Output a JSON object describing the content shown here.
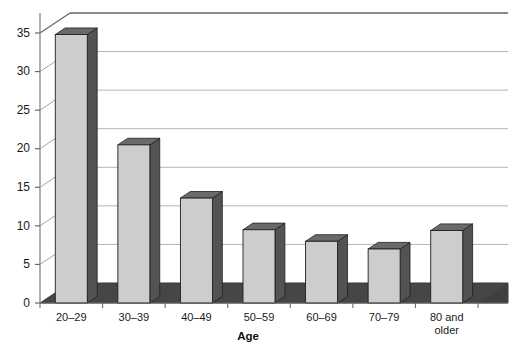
{
  "chart_data": {
    "type": "bar",
    "title": "",
    "subtitle": "",
    "xlabel": "Age",
    "ylabel": "",
    "categories": [
      "20–29",
      "30–39",
      "40–49",
      "50–59",
      "60–69",
      "70–79",
      "80 and older"
    ],
    "values": [
      34.8,
      20.5,
      13.6,
      9.5,
      8.0,
      7.0,
      9.4
    ],
    "ylim": [
      0,
      37
    ],
    "yticks": [
      0,
      5,
      10,
      15,
      20,
      25,
      30,
      35
    ],
    "ytick_labels": [
      "0",
      "5",
      "10",
      "15",
      "20",
      "25",
      "30",
      "35"
    ],
    "grid": true,
    "grid_axis": "y",
    "legend": false,
    "legend_position": "none",
    "style": "3d-perspective-bars",
    "annotations": []
  },
  "colors": {
    "bar_front": "#d2d2d2",
    "bar_side": "#575757",
    "bar_top": "#6d6d6d",
    "bar_outline": "#1f1f1f",
    "floor": "#4a4a4a",
    "floor_edge": "#2b2b2b",
    "gridline": "#b4b4b4",
    "axis_line": "#8d8d8d",
    "wall_line": "#9a9a9a",
    "text": "#1a1a1a",
    "background": "#ffffff"
  },
  "xaxis": {
    "label": "Age",
    "tick_labels": [
      {
        "line1": "20–29",
        "line2": ""
      },
      {
        "line1": "30–39",
        "line2": ""
      },
      {
        "line1": "40–49",
        "line2": ""
      },
      {
        "line1": "50–59",
        "line2": ""
      },
      {
        "line1": "60–69",
        "line2": ""
      },
      {
        "line1": "70–79",
        "line2": ""
      },
      {
        "line1": "80 and",
        "line2": "older"
      }
    ]
  },
  "yaxis": {
    "tick_labels": [
      "0",
      "5",
      "10",
      "15",
      "20",
      "25",
      "30",
      "35"
    ]
  }
}
